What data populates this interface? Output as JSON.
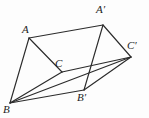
{
  "figure": {
    "kind": "geometry-diagram",
    "background_color": "#fdfdfd",
    "line_color": "#2b2b2b",
    "label_color": "#1c1c1c",
    "width": 149,
    "height": 118,
    "vertices": [
      {
        "id": "A",
        "label": "A",
        "x": 29,
        "y": 38,
        "label_x": 22,
        "label_y": 24
      },
      {
        "id": "B",
        "label": "B",
        "x": 10,
        "y": 103,
        "label_x": 3,
        "label_y": 104
      },
      {
        "id": "C",
        "label": "C",
        "x": 62,
        "y": 72,
        "label_x": 55,
        "label_y": 58
      },
      {
        "id": "Ap",
        "label": "A′",
        "x": 103,
        "y": 25,
        "label_x": 96,
        "label_y": 4
      },
      {
        "id": "Bp",
        "label": "B′",
        "x": 84,
        "y": 90,
        "label_x": 77,
        "label_y": 92
      },
      {
        "id": "Cp",
        "label": "C′",
        "x": 131,
        "y": 57,
        "label_x": 127,
        "label_y": 40
      }
    ],
    "edges": [
      {
        "id": "A-B",
        "from": "A",
        "to": "B",
        "x1": 29,
        "y1": 38,
        "x2": 10,
        "y2": 103
      },
      {
        "id": "A-C",
        "from": "A",
        "to": "C",
        "x1": 29,
        "y1": 38,
        "x2": 62,
        "y2": 72
      },
      {
        "id": "B-C",
        "from": "B",
        "to": "C",
        "x1": 10,
        "y1": 103,
        "x2": 62,
        "y2": 72
      },
      {
        "id": "A-Ap",
        "from": "A",
        "to": "Ap",
        "x1": 29,
        "y1": 38,
        "x2": 103,
        "y2": 25
      },
      {
        "id": "B-Bp",
        "from": "B",
        "to": "Bp",
        "x1": 10,
        "y1": 103,
        "x2": 84,
        "y2": 90
      },
      {
        "id": "C-Cp",
        "from": "C",
        "to": "Cp",
        "x1": 62,
        "y1": 72,
        "x2": 131,
        "y2": 57
      },
      {
        "id": "Ap-Bp",
        "from": "Ap",
        "to": "Bp",
        "x1": 103,
        "y1": 25,
        "x2": 84,
        "y2": 90
      },
      {
        "id": "Ap-Cp",
        "from": "Ap",
        "to": "Cp",
        "x1": 103,
        "y1": 25,
        "x2": 131,
        "y2": 57
      },
      {
        "id": "Bp-Cp",
        "from": "Bp",
        "to": "Cp",
        "x1": 84,
        "y1": 90,
        "x2": 131,
        "y2": 57
      },
      {
        "id": "B-Cp",
        "from": "B",
        "to": "Cp",
        "x1": 10,
        "y1": 103,
        "x2": 131,
        "y2": 57
      }
    ]
  }
}
